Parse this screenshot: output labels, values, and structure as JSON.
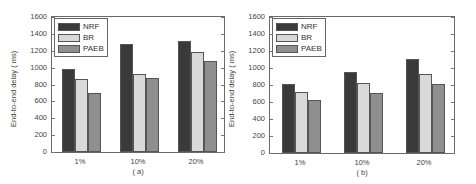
{
  "colors": {
    "NRF": "#3a3a3a",
    "BR": "#d9d9d9",
    "PAEB": "#8f8f8f"
  },
  "chart_data": [
    {
      "type": "bar",
      "title": "",
      "caption": "( a)",
      "xlabel": "",
      "ylabel": "End-to-end delay ( ms)",
      "ylim": [
        0,
        1600
      ],
      "yticks": [
        0,
        200,
        400,
        600,
        800,
        1000,
        1200,
        1400,
        1600
      ],
      "categories": [
        "1%",
        "10%",
        "20%"
      ],
      "legend_position": "upper left",
      "grid": false,
      "series": [
        {
          "name": "NRF",
          "values": [
            980,
            1280,
            1320
          ]
        },
        {
          "name": "BR",
          "values": [
            870,
            920,
            1180
          ]
        },
        {
          "name": "PAEB",
          "values": [
            700,
            880,
            1080
          ]
        }
      ]
    },
    {
      "type": "bar",
      "title": "",
      "caption": "( b)",
      "xlabel": "",
      "ylabel": "End-to-end delay ( ms)",
      "ylim": [
        0,
        1600
      ],
      "yticks": [
        0,
        200,
        400,
        600,
        800,
        1000,
        1200,
        1400,
        1600
      ],
      "categories": [
        "1%",
        "10%",
        "20%"
      ],
      "legend_position": "upper left",
      "grid": false,
      "series": [
        {
          "name": "NRF",
          "values": [
            810,
            950,
            1110
          ]
        },
        {
          "name": "BR",
          "values": [
            720,
            820,
            930
          ]
        },
        {
          "name": "PAEB",
          "values": [
            620,
            710,
            810
          ]
        }
      ]
    }
  ]
}
